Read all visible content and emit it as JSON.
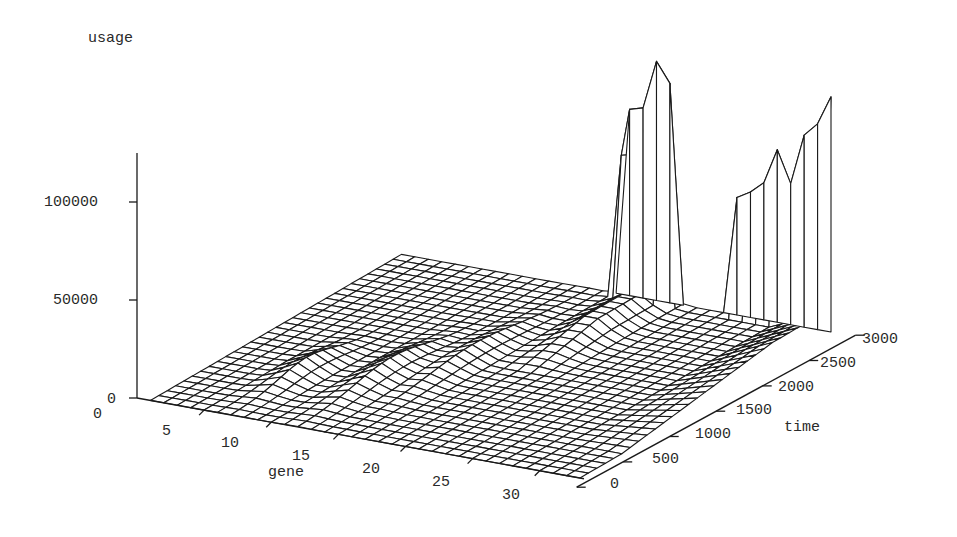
{
  "chart_data": {
    "type": "surface",
    "title": "",
    "zlabel": "usage",
    "xlabel": "gene",
    "ylabel": "time",
    "x_range": [
      1,
      33
    ],
    "y_range": [
      0,
      3000
    ],
    "z_range": [
      0,
      130000
    ],
    "x_ticks": [
      0,
      5,
      10,
      15,
      20,
      25,
      30
    ],
    "y_ticks": [
      0,
      500,
      1000,
      1500,
      2000,
      2500,
      3000
    ],
    "z_ticks": [
      0,
      50000,
      100000
    ],
    "grid": false,
    "legend": false,
    "grid_resolution": {
      "genes": 33,
      "time_steps": 31
    },
    "features": [
      {
        "name": "large peak",
        "gene_range": [
          17,
          22
        ],
        "time_range": [
          2300,
          3000
        ],
        "peak_values": [
          0,
          90000,
          95000,
          120000,
          110000,
          0
        ]
      },
      {
        "name": "late ridge",
        "gene_range": [
          26,
          33
        ],
        "time": 3000,
        "peak_values": [
          60000,
          62000,
          66000,
          70000,
          80000,
          78000,
          95000,
          105000
        ]
      },
      {
        "name": "small ridges",
        "gene_range": [
          4,
          16
        ],
        "time_range": [
          300,
          2000
        ],
        "approx_max": 10000
      },
      {
        "name": "diagonal ramp",
        "gene": 33,
        "time_range": [
          500,
          2800
        ],
        "approx_max": 15000
      }
    ],
    "peak_profile_large": [
      {
        "gene": 18,
        "value": 95000
      },
      {
        "gene": 19,
        "value": 97000
      },
      {
        "gene": 20,
        "value": 122000
      },
      {
        "gene": 21,
        "value": 112000
      }
    ],
    "peak_profile_late": [
      {
        "gene": 26,
        "value": 60000
      },
      {
        "gene": 27,
        "value": 64000
      },
      {
        "gene": 28,
        "value": 70000
      },
      {
        "gene": 29,
        "value": 88000
      },
      {
        "gene": 30,
        "value": 72000
      },
      {
        "gene": 31,
        "value": 98000
      },
      {
        "gene": 32,
        "value": 105000
      },
      {
        "gene": 33,
        "value": 120000
      }
    ]
  },
  "labels": {
    "zlabel": "usage",
    "xlabel": "gene",
    "ylabel": "time",
    "z_ticks": [
      "0",
      "50000",
      "100000"
    ],
    "x_ticks": [
      "0",
      "5",
      "10",
      "15",
      "20",
      "25",
      "30"
    ],
    "y_ticks": [
      "0",
      "500",
      "1000",
      "1500",
      "2000",
      "2500",
      "3000"
    ]
  }
}
